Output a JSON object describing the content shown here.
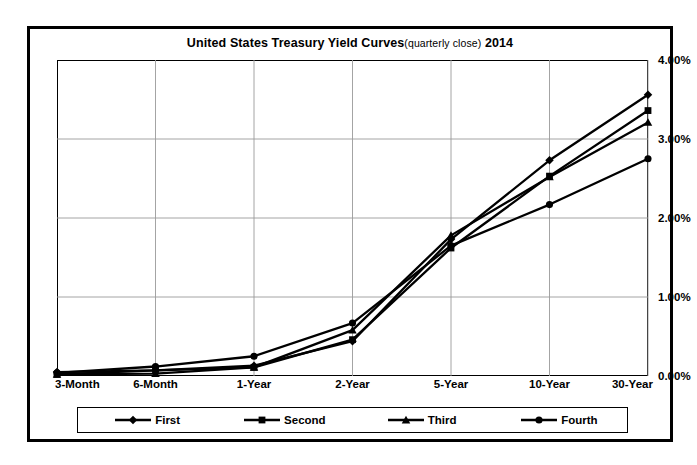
{
  "title": {
    "main": "United States Treasury Yield Curves",
    "sub": "(quarterly close)",
    "year": "2014"
  },
  "axis": {
    "y_ticks": [
      "0.00%",
      "1.00%",
      "2.00%",
      "3.00%",
      "4.00%"
    ],
    "x_ticks": [
      "3-Month",
      "6-Month",
      "1-Year",
      "2-Year",
      "5-Year",
      "10-Year",
      "30-Year"
    ]
  },
  "legend": {
    "items": [
      {
        "label": "First",
        "marker": "diamond-marker-icon"
      },
      {
        "label": "Second",
        "marker": "square-marker-icon"
      },
      {
        "label": "Third",
        "marker": "triangle-marker-icon"
      },
      {
        "label": "Fourth",
        "marker": "circle-marker-icon"
      }
    ]
  },
  "chart_data": {
    "type": "line",
    "xlabel": "",
    "ylabel": "",
    "ylim": [
      0,
      4
    ],
    "ytick_format": "percent",
    "grid": true,
    "legend_position": "bottom",
    "categories": [
      "3-Month",
      "6-Month",
      "1-Year",
      "2-Year",
      "5-Year",
      "10-Year",
      "30-Year"
    ],
    "series": [
      {
        "name": "First",
        "marker": "diamond",
        "values": [
          0.05,
          0.07,
          0.13,
          0.44,
          1.73,
          2.73,
          3.56
        ]
      },
      {
        "name": "Second",
        "marker": "square",
        "values": [
          0.02,
          0.07,
          0.11,
          0.46,
          1.62,
          2.53,
          3.36
        ]
      },
      {
        "name": "Third",
        "marker": "triangle",
        "values": [
          0.02,
          0.03,
          0.11,
          0.58,
          1.78,
          2.52,
          3.21
        ]
      },
      {
        "name": "Fourth",
        "marker": "circle",
        "values": [
          0.04,
          0.12,
          0.25,
          0.67,
          1.65,
          2.17,
          2.75
        ]
      }
    ]
  }
}
